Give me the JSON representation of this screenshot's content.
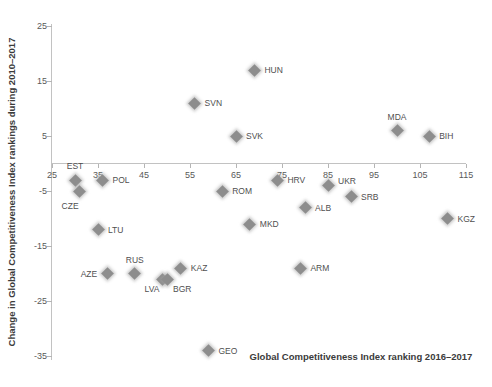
{
  "chart_data": {
    "type": "scatter",
    "title": "",
    "xlabel": "Global Competitiveness Index ranking 2016–2017",
    "ylabel": "Change in Global Competitiveness Index rankings during 2010–2017",
    "xlim": [
      25,
      115
    ],
    "ylim": [
      -35,
      25
    ],
    "x_ticks": [
      25,
      35,
      45,
      55,
      65,
      75,
      85,
      95,
      105,
      115
    ],
    "y_ticks": [
      25,
      15,
      5,
      -5,
      -15,
      -25,
      -35
    ],
    "grid": false,
    "legend": false,
    "marker": "diamond",
    "colors": {
      "marker": "#8d8d8d",
      "marker_glow": "#b5b5b5",
      "axis_line": "#c2c2c2",
      "tick_text": "#595959",
      "axis_title_text": "#3b3b3b",
      "point_label_text": "#4f4f4f",
      "background": "#ffffff"
    },
    "points": [
      {
        "label": "EST",
        "x": 30,
        "y": -3,
        "label_pos": "above"
      },
      {
        "label": "CZE",
        "x": 31,
        "y": -5,
        "label_pos": "below-left-far"
      },
      {
        "label": "POL",
        "x": 36,
        "y": -3,
        "label_pos": "right"
      },
      {
        "label": "LTU",
        "x": 35,
        "y": -12,
        "label_pos": "right"
      },
      {
        "label": "AZE",
        "x": 37,
        "y": -20,
        "label_pos": "left"
      },
      {
        "label": "RUS",
        "x": 43,
        "y": -20,
        "label_pos": "above"
      },
      {
        "label": "LVA",
        "x": 49,
        "y": -21,
        "label_pos": "below-left"
      },
      {
        "label": "BGR",
        "x": 50,
        "y": -21,
        "label_pos": "below-right"
      },
      {
        "label": "KAZ",
        "x": 53,
        "y": -19,
        "label_pos": "right"
      },
      {
        "label": "SVN",
        "x": 56,
        "y": 11,
        "label_pos": "right"
      },
      {
        "label": "GEO",
        "x": 59,
        "y": -34,
        "label_pos": "right"
      },
      {
        "label": "ROM",
        "x": 62,
        "y": -5,
        "label_pos": "right"
      },
      {
        "label": "SVK",
        "x": 65,
        "y": 5,
        "label_pos": "right"
      },
      {
        "label": "MKD",
        "x": 68,
        "y": -11,
        "label_pos": "right"
      },
      {
        "label": "HUN",
        "x": 69,
        "y": 17,
        "label_pos": "right"
      },
      {
        "label": "HRV",
        "x": 74,
        "y": -3,
        "label_pos": "right"
      },
      {
        "label": "ARM",
        "x": 79,
        "y": -19,
        "label_pos": "right"
      },
      {
        "label": "ALB",
        "x": 80,
        "y": -8,
        "label_pos": "right"
      },
      {
        "label": "UKR",
        "x": 85,
        "y": -4,
        "label_pos": "right-up"
      },
      {
        "label": "SRB",
        "x": 90,
        "y": -6,
        "label_pos": "right"
      },
      {
        "label": "MDA",
        "x": 100,
        "y": 6,
        "label_pos": "above"
      },
      {
        "label": "BIH",
        "x": 107,
        "y": 5,
        "label_pos": "right"
      },
      {
        "label": "KGZ",
        "x": 111,
        "y": -10,
        "label_pos": "right"
      }
    ]
  }
}
